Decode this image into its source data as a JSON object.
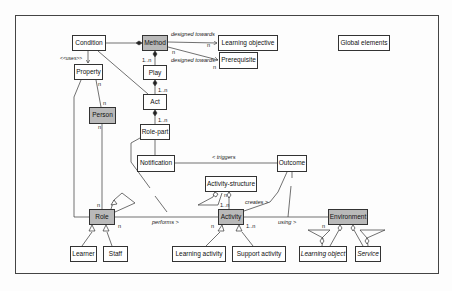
{
  "diagram": {
    "type": "uml-class-diagram",
    "classes": {
      "condition": "Condition",
      "method": "Method",
      "learning_objective": "Learning objective",
      "global_elements": "Global elements",
      "prerequisite": "Prerequisite",
      "property": "Property",
      "play": "Play",
      "act": "Act",
      "person": "Person",
      "role_part": "Role-part",
      "notification": "Notification",
      "outcome": "Outcome",
      "activity_structure": "Activity-structure",
      "role": "Role",
      "activity": "Activity",
      "environment": "Environment",
      "learner": "Learner",
      "staff": "Staff",
      "learning_activity": "Learning activity",
      "support_activity": "Support activity",
      "learning_object": "Learning object",
      "service": "Service"
    },
    "shaded_classes": [
      "Method",
      "Person",
      "Role",
      "Activity",
      "Environment"
    ],
    "italic_classes": [
      "Learning object",
      "Service"
    ],
    "association_labels": {
      "designed_towards_1": "designed towards",
      "designed_towards_2": "designed towards",
      "uses": "<<uses>>",
      "triggers": "< triggers",
      "performs": "performs >",
      "creates": "creates >",
      "using": "using >"
    },
    "multiplicities": {
      "lo_n": "n",
      "method_n": "n",
      "prereq_n": "n",
      "play_1n": "1..n",
      "act_1n": "1..n",
      "rolepart_1n": "1..n",
      "property_n": "n",
      "person_top_n": "n",
      "person_bottom_n": "n",
      "role_top_n": "n",
      "role_right_n": "n",
      "activity_left_n": "n",
      "activity_right_1n": "1..n",
      "activity_top_1n": "1..n",
      "activity_top_n": "n",
      "environment_n": "n"
    },
    "colors": {
      "line": "#333333",
      "box_border": "#333333",
      "shaded_fill": "#b9b9b9",
      "background": "#fdfdfd"
    }
  }
}
